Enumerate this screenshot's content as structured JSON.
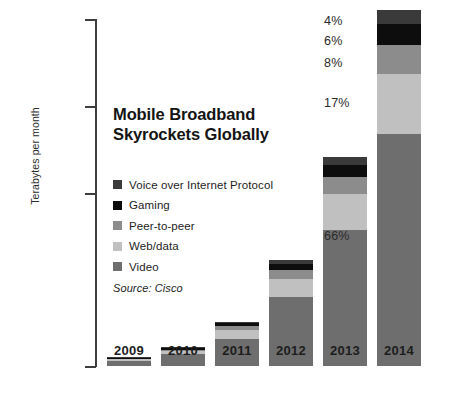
{
  "chart_data": {
    "type": "bar",
    "subtype": "stacked-bar",
    "title": "Mobile Broadband\nSkyrockets Globally",
    "source": "Source: Cisco",
    "xlabel": "",
    "ylabel": "Terabytes per month",
    "categories": [
      "2009",
      "2010",
      "2011",
      "2012",
      "2013",
      "2014"
    ],
    "ytick_labels": [
      "3 600 000",
      "2 700 000",
      "1 800 000",
      "900 000",
      "0"
    ],
    "ytick_values": [
      3600000,
      2700000,
      1800000,
      900000,
      0
    ],
    "ylim": [
      0,
      3600000
    ],
    "grid": false,
    "legend_position": "inside-left",
    "stack_order_top_to_bottom": [
      "Voice over Internet Protocol",
      "Gaming",
      "Peer-to-peer",
      "Web/data",
      "Video"
    ],
    "series": [
      {
        "name": "Voice over Internet Protocol",
        "color": "#3a3a3a",
        "values": [
          2000,
          5000,
          14000,
          40000,
          85000,
          148000
        ]
      },
      {
        "name": "Gaming",
        "color": "#0d0d0d",
        "values": [
          4000,
          12000,
          26000,
          62000,
          128000,
          222000
        ]
      },
      {
        "name": "Peer-to-peer",
        "color": "#8c8c8c",
        "values": [
          4000,
          10000,
          34000,
          85000,
          172000,
          296000
        ]
      },
      {
        "name": "Web/data",
        "color": "#c0c0c0",
        "values": [
          10000,
          26000,
          86000,
          188000,
          370000,
          629000
        ]
      },
      {
        "name": "Video",
        "color": "#6e6e6e",
        "values": [
          70000,
          127000,
          290000,
          715000,
          1415000,
          2405000
        ]
      }
    ],
    "totals": [
      90000,
      180000,
      450000,
      1090000,
      2170000,
      3700000
    ],
    "annotations_2014_share": [
      {
        "label": "4%",
        "series": "Voice over Internet Protocol",
        "value": 4
      },
      {
        "label": "6%",
        "series": "Gaming",
        "value": 6
      },
      {
        "label": "8%",
        "series": "Peer-to-peer",
        "value": 8
      },
      {
        "label": "17%",
        "series": "Web/data",
        "value": 17
      },
      {
        "label": "66%",
        "series": "Video",
        "value": 66
      }
    ]
  },
  "axis": {
    "ticks": [
      {
        "label": "3 600 000",
        "top": 19,
        "show_mark": true
      },
      {
        "label": "2 700 000",
        "top": 106,
        "show_mark": true
      },
      {
        "label": "1 800 000",
        "top": 193,
        "show_mark": true
      },
      {
        "label": "900 000",
        "top": 280,
        "show_mark": false
      },
      {
        "label": "0",
        "top": 366,
        "show_mark": true
      }
    ],
    "y_axis_title": "Terabytes per month"
  },
  "legend": {
    "items": [
      {
        "label": "Voice over Internet Protocol",
        "color": "#3a3a3a"
      },
      {
        "label": "Gaming",
        "color": "#0d0d0d"
      },
      {
        "label": "Peer-to-peer",
        "color": "#8c8c8c"
      },
      {
        "label": "Web/data",
        "color": "#c0c0c0"
      },
      {
        "label": "Video",
        "color": "#6e6e6e"
      }
    ]
  },
  "percent_callouts": [
    {
      "label": "4%",
      "top": 14
    },
    {
      "label": "6%",
      "top": 34
    },
    {
      "label": "8%",
      "top": 56
    },
    {
      "label": "17%",
      "top": 96
    },
    {
      "label": "66%",
      "top": 229
    }
  ],
  "bars": [
    {
      "year": "2009",
      "left": 12,
      "segments": [
        {
          "series": "Voice over Internet Protocol",
          "color": "#3a3a3a",
          "height": 0.5
        },
        {
          "series": "Gaming",
          "color": "#0d0d0d",
          "height": 0.8
        },
        {
          "series": "Peer-to-peer",
          "color": "#8c8c8c",
          "height": 0.7
        },
        {
          "series": "Web/data",
          "color": "#c0c0c0",
          "height": 1.3
        },
        {
          "series": "Video",
          "color": "#6e6e6e",
          "height": 5.4
        }
      ]
    },
    {
      "year": "2010",
      "left": 66,
      "segments": [
        {
          "series": "Voice over Internet Protocol",
          "color": "#3a3a3a",
          "height": 0.8
        },
        {
          "series": "Gaming",
          "color": "#0d0d0d",
          "height": 2.2
        },
        {
          "series": "Peer-to-peer",
          "color": "#8c8c8c",
          "height": 1.2
        },
        {
          "series": "Web/data",
          "color": "#c0c0c0",
          "height": 2.6
        },
        {
          "series": "Video",
          "color": "#6e6e6e",
          "height": 12.5
        }
      ]
    },
    {
      "year": "2011",
      "left": 120,
      "segments": [
        {
          "series": "Voice over Internet Protocol",
          "color": "#3a3a3a",
          "height": 1.8
        },
        {
          "series": "Gaming",
          "color": "#0d0d0d",
          "height": 3.0
        },
        {
          "series": "Peer-to-peer",
          "color": "#8c8c8c",
          "height": 3.6
        },
        {
          "series": "Web/data",
          "color": "#c0c0c0",
          "height": 8.6
        },
        {
          "series": "Video",
          "color": "#6e6e6e",
          "height": 27.4
        }
      ]
    },
    {
      "year": "2012",
      "left": 174,
      "segments": [
        {
          "series": "Voice over Internet Protocol",
          "color": "#3a3a3a",
          "height": 4.0
        },
        {
          "series": "Gaming",
          "color": "#0d0d0d",
          "height": 6.4
        },
        {
          "series": "Peer-to-peer",
          "color": "#8c8c8c",
          "height": 8.4
        },
        {
          "series": "Web/data",
          "color": "#c0c0c0",
          "height": 18.6
        },
        {
          "series": "Video",
          "color": "#6e6e6e",
          "height": 68.6
        }
      ]
    },
    {
      "year": "2013",
      "left": 228,
      "segments": [
        {
          "series": "Voice over Internet Protocol",
          "color": "#3a3a3a",
          "height": 8.2
        },
        {
          "series": "Gaming",
          "color": "#0d0d0d",
          "height": 12.4
        },
        {
          "series": "Peer-to-peer",
          "color": "#8c8c8c",
          "height": 16.6
        },
        {
          "series": "Web/data",
          "color": "#c0c0c0",
          "height": 35.7
        },
        {
          "series": "Video",
          "color": "#6e6e6e",
          "height": 136.3
        }
      ]
    },
    {
      "year": "2014",
      "left": 282,
      "segments": [
        {
          "series": "Voice over Internet Protocol",
          "color": "#3a3a3a",
          "height": 14.3
        },
        {
          "series": "Gaming",
          "color": "#0d0d0d",
          "height": 21.4
        },
        {
          "series": "Peer-to-peer",
          "color": "#8c8c8c",
          "height": 28.5
        },
        {
          "series": "Web/data",
          "color": "#c0c0c0",
          "height": 60.6
        },
        {
          "series": "Video",
          "color": "#6e6e6e",
          "height": 231.7
        }
      ]
    }
  ]
}
